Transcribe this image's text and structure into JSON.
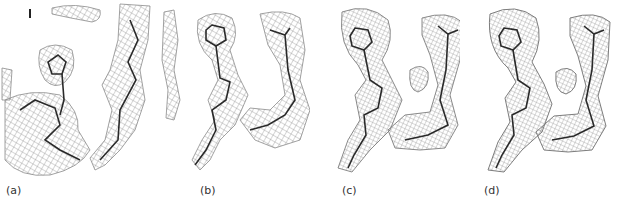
{
  "figure": {
    "type": "electron density map comparison",
    "panels": [
      {
        "id": "a",
        "label": "(a)"
      },
      {
        "id": "b",
        "label": "(b)"
      },
      {
        "id": "c",
        "label": "(c)"
      },
      {
        "id": "d",
        "label": "(d)"
      }
    ],
    "colors": {
      "mesh": "#8a8a8a",
      "model": "#2a2a2a",
      "background": "#ffffff"
    }
  }
}
